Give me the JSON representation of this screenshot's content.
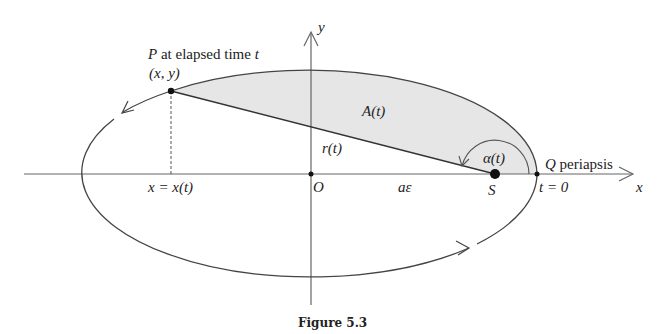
{
  "figure": {
    "caption": "Figure 5.3",
    "colors": {
      "stroke": "#444444",
      "shade": "#e6e6e6",
      "text": "#222222"
    },
    "labels": {
      "point_p": "P",
      "point_p_desc": "at elapsed time",
      "point_p_t": "t",
      "coords": "(x, y)",
      "area": "A(t)",
      "radius": "r(t)",
      "angle": "α(t)",
      "point_q": "Q",
      "periapsis": "periapsis",
      "t_zero": "t = 0",
      "x_axis": "x",
      "y_axis": "y",
      "origin": "O",
      "focal_offset": "aε",
      "focus": "S",
      "x_of_t": "x = x(t)"
    }
  }
}
